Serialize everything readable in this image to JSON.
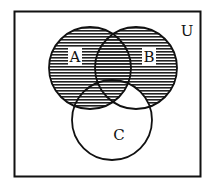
{
  "diagram": {
    "type": "venn",
    "universe_label": "U",
    "sets": [
      {
        "id": "A",
        "label": "A",
        "cx": 90,
        "cy": 68,
        "r": 41
      },
      {
        "id": "B",
        "label": "B",
        "cx": 136,
        "cy": 68,
        "r": 41
      },
      {
        "id": "C",
        "label": "C",
        "cx": 112,
        "cy": 120,
        "r": 40
      }
    ],
    "shaded_region": "A ∪ (B − C)",
    "unshaded_regions_within_sets": [
      "(B ∩ C) − A",
      "C − (A ∪ B)"
    ],
    "colors": {
      "stroke": "#111111",
      "hatch": "#222222",
      "background": "#ffffff"
    }
  }
}
